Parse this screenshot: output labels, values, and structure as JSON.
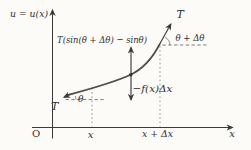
{
  "figure": {
    "colors": {
      "background": "#fcfbf8",
      "axis": "#3a3a3a",
      "curve": "#4d4d4d",
      "text": "#2e2e2e",
      "dotted_guides": "#8a8a8a",
      "dashed_guides": "#5c5c5c"
    },
    "axes": {
      "y_title": "u = u(x)",
      "origin": "O",
      "x_tick": "x",
      "x_plus_dx_tick": "x + Δx",
      "x_axis_label": "x"
    },
    "tension": {
      "upper_label": "T",
      "lower_label": "T"
    },
    "angles": {
      "lower": "θ",
      "upper": "θ + Δθ"
    },
    "forces": {
      "net_tension": "T(sin(θ + Δθ) − sinθ)",
      "distributed_load": "−f(x)Δx"
    }
  }
}
